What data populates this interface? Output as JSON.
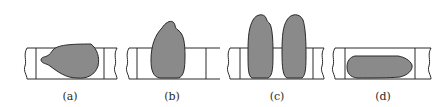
{
  "figure": {
    "colors": {
      "background": "#ffffff",
      "outline": "#2a2a2a",
      "fill": "#8a8a8a"
    },
    "panels": [
      {
        "id": "a",
        "label": "(a)",
        "label_x": 70,
        "description": "low, wide bead leaning left within the strip"
      },
      {
        "id": "b",
        "label": "(b)",
        "label_x": 172,
        "description": "tall single bead rising above the strip"
      },
      {
        "id": "c",
        "label": "(c)",
        "label_x": 277,
        "description": "two tall parallel beads rising above the strip"
      },
      {
        "id": "d",
        "label": "(d)",
        "label_x": 383,
        "description": "flat elongated bead inside the strip"
      }
    ]
  }
}
